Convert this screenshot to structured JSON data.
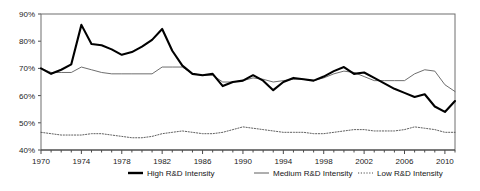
{
  "chart_data": {
    "type": "line",
    "title": "",
    "subtitle": "",
    "xlabel": "",
    "ylabel": "",
    "xlim": [
      1970,
      2011
    ],
    "ylim": [
      40,
      90
    ],
    "ytick_labels": [
      "90%",
      "80%",
      "70%",
      "60%",
      "50%",
      "40%"
    ],
    "ytick_values": [
      90,
      80,
      70,
      60,
      50,
      40
    ],
    "xtick_labels": [
      "1970",
      "1974",
      "1978",
      "1982",
      "1986",
      "1990",
      "1994",
      "1998",
      "2002",
      "2006",
      "2010"
    ],
    "xtick_values": [
      1970,
      1974,
      1978,
      1982,
      1986,
      1990,
      1994,
      1998,
      2002,
      2006,
      2010
    ],
    "minor_xticks_interval": 1,
    "grid": false,
    "legend_position": "bottom-center",
    "x": [
      1970,
      1971,
      1972,
      1973,
      1974,
      1975,
      1976,
      1977,
      1978,
      1979,
      1980,
      1981,
      1982,
      1983,
      1984,
      1985,
      1986,
      1987,
      1988,
      1989,
      1990,
      1991,
      1992,
      1993,
      1994,
      1995,
      1996,
      1997,
      1998,
      1999,
      2000,
      2001,
      2002,
      2003,
      2004,
      2005,
      2006,
      2007,
      2008,
      2009,
      2010,
      2011
    ],
    "series": [
      {
        "name": "High R&D Intensity",
        "style": "solid-thick",
        "color": "#000000",
        "values": [
          70.0,
          68.0,
          69.5,
          71.5,
          86.0,
          79.0,
          78.5,
          77.0,
          75.0,
          76.0,
          78.0,
          80.5,
          84.5,
          76.5,
          71.0,
          68.0,
          67.5,
          68.0,
          63.5,
          65.0,
          65.5,
          67.5,
          65.5,
          62.0,
          65.0,
          66.5,
          66.0,
          65.5,
          67.0,
          69.0,
          70.5,
          68.0,
          68.5,
          66.5,
          64.5,
          62.5,
          61.0,
          59.5,
          60.5,
          56.0,
          54.0,
          58.0
        ]
      },
      {
        "name": "Medium R&D Intensity",
        "style": "solid-thin",
        "color": "#5e5e5e",
        "values": [
          70.0,
          68.5,
          68.5,
          68.5,
          70.5,
          69.5,
          68.5,
          68.0,
          68.0,
          68.0,
          68.0,
          68.0,
          70.5,
          70.5,
          70.5,
          68.0,
          67.5,
          67.5,
          65.0,
          65.0,
          65.5,
          66.5,
          66.0,
          65.0,
          65.5,
          66.0,
          66.0,
          65.5,
          66.5,
          68.0,
          69.0,
          68.5,
          67.0,
          65.5,
          65.5,
          65.5,
          65.5,
          68.0,
          69.5,
          69.0,
          64.0,
          61.5
        ]
      },
      {
        "name": "Low R&D Intensity",
        "style": "dotted",
        "color": "#4d4d4d",
        "values": [
          46.5,
          46.0,
          45.5,
          45.5,
          45.5,
          46.0,
          46.0,
          45.5,
          45.0,
          44.5,
          44.5,
          45.0,
          46.0,
          46.5,
          47.0,
          46.5,
          46.0,
          46.0,
          46.5,
          47.5,
          48.5,
          48.0,
          47.5,
          47.0,
          46.5,
          46.5,
          46.5,
          46.0,
          46.0,
          46.5,
          47.0,
          47.5,
          47.5,
          47.0,
          47.0,
          47.0,
          47.5,
          48.5,
          48.0,
          47.5,
          46.5,
          46.5
        ]
      }
    ]
  },
  "legend": {
    "items": [
      {
        "label": "High R&D Intensity"
      },
      {
        "label": "Medium R&D Intensity"
      },
      {
        "label": "Low R&D Intensity"
      }
    ]
  }
}
